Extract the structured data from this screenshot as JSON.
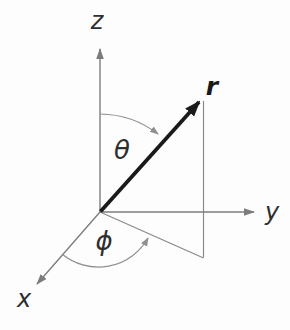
{
  "figure": {
    "colors": {
      "background": "#fdfdfd",
      "axis": "#7c7c7c",
      "arc": "#8f8f8f",
      "projection": "#8a8a8a",
      "vector": "#1a1a1a",
      "label": "#2e2e2e"
    },
    "labels": {
      "z_axis": "z",
      "y_axis": "y",
      "x_axis": "x",
      "vector": "r",
      "polar_angle": "θ",
      "azimuth_angle": "ϕ"
    }
  }
}
